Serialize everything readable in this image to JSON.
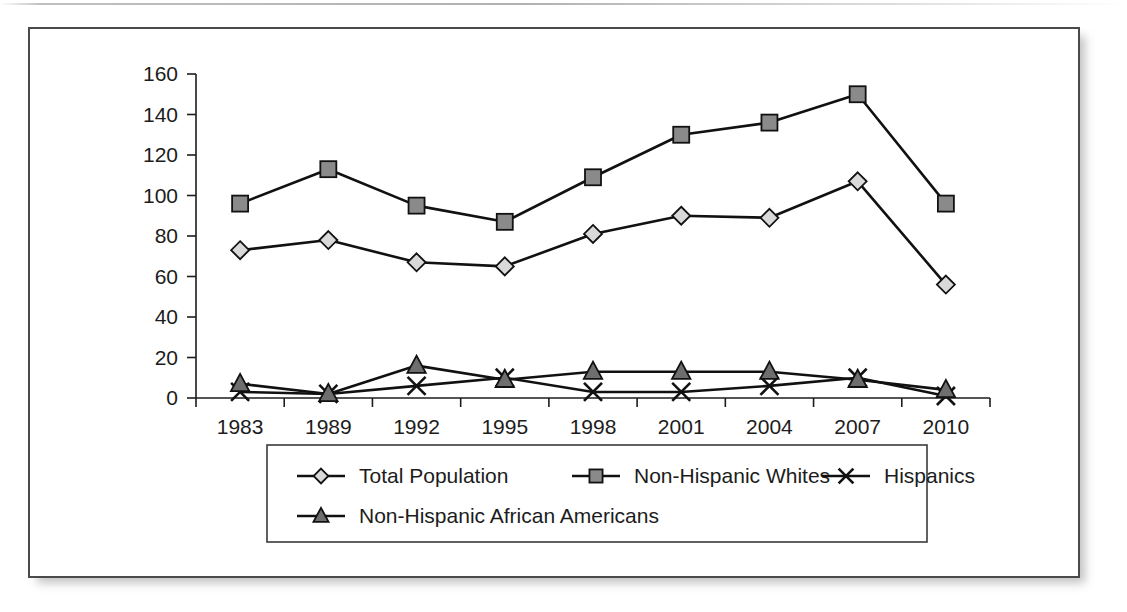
{
  "figure": {
    "frame_border_color": "#4a4a4a",
    "background_color": "#ffffff",
    "line_color": "#111111"
  },
  "chart_data": {
    "type": "line",
    "title": "",
    "subtitle": "",
    "xlabel": "",
    "ylabel": "",
    "categories": [
      "1983",
      "1989",
      "1992",
      "1995",
      "1998",
      "2001",
      "2004",
      "2007",
      "2010"
    ],
    "ylim": [
      0,
      160
    ],
    "y_ticks": [
      "0",
      "20",
      "40",
      "60",
      "80",
      "100",
      "120",
      "140",
      "160"
    ],
    "y_tick_values": [
      0,
      20,
      40,
      60,
      80,
      100,
      120,
      140,
      160
    ],
    "grid": false,
    "legend_position": "bottom",
    "series": [
      {
        "name": "Total Population",
        "marker": "diamond",
        "marker_fill": "#d9d9d9",
        "values": [
          73,
          78,
          67,
          65,
          81,
          90,
          89,
          107,
          56
        ]
      },
      {
        "name": "Non-Hispanic Whites",
        "marker": "square",
        "marker_fill": "#8a8a8a",
        "values": [
          96,
          113,
          95,
          87,
          109,
          130,
          136,
          150,
          96
        ]
      },
      {
        "name": "Hispanics",
        "marker": "cross",
        "marker_fill": "#111111",
        "values": [
          3,
          2,
          6,
          10,
          3,
          3,
          6,
          10,
          1
        ]
      },
      {
        "name": "Non-Hispanic African Americans",
        "marker": "triangle",
        "marker_fill": "#6e6e6e",
        "values": [
          7,
          2,
          16,
          9,
          13,
          13,
          13,
          9,
          4
        ]
      }
    ]
  },
  "legend": {
    "rows": [
      [
        "Total Population",
        "Non-Hispanic Whites",
        "Hispanics"
      ],
      [
        "Non-Hispanic African Americans"
      ]
    ]
  }
}
